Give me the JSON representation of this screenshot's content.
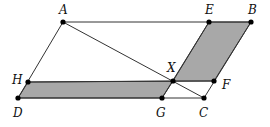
{
  "diagram": {
    "type": "geometry",
    "colors": {
      "line": "#333333",
      "fill": "#a8a8a8",
      "point": "#000000"
    },
    "points": {
      "A": {
        "label": "A",
        "x": 63,
        "y": 22
      },
      "E": {
        "label": "E",
        "x": 209,
        "y": 22
      },
      "B": {
        "label": "B",
        "x": 251,
        "y": 22
      },
      "H": {
        "label": "H",
        "x": 28,
        "y": 82
      },
      "X": {
        "label": "X",
        "x": 173,
        "y": 81
      },
      "F": {
        "label": "F",
        "x": 214,
        "y": 81
      },
      "D": {
        "label": "D",
        "x": 18,
        "y": 98
      },
      "G": {
        "label": "G",
        "x": 162,
        "y": 98
      },
      "C": {
        "label": "C",
        "x": 204,
        "y": 98
      }
    },
    "shaded_regions": [
      {
        "name": "parallelogram-EBFX",
        "vertices": [
          "E",
          "B",
          "F",
          "X"
        ]
      },
      {
        "name": "parallelogram-HXGD",
        "vertices": [
          "H",
          "X",
          "G",
          "D"
        ]
      }
    ],
    "segments": [
      [
        "A",
        "B"
      ],
      [
        "B",
        "C"
      ],
      [
        "C",
        "D"
      ],
      [
        "D",
        "A"
      ],
      [
        "A",
        "C"
      ],
      [
        "E",
        "G"
      ],
      [
        "H",
        "F"
      ]
    ]
  }
}
